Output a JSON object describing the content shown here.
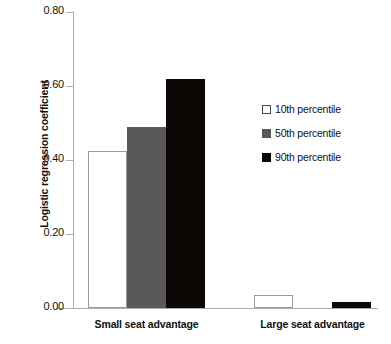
{
  "chart_data": {
    "type": "bar",
    "title": "",
    "xlabel": "",
    "ylabel": "Logistic regression coefficient",
    "categories": [
      "Small seat advantage",
      "Large seat advantage"
    ],
    "series": [
      {
        "name": "10th percentile",
        "values": [
          0.425,
          0.035
        ],
        "color": "#ffffff"
      },
      {
        "name": "50th percentile",
        "values": [
          0.49,
          0.0
        ],
        "color": "#59595a"
      },
      {
        "name": "90th percentile",
        "values": [
          0.62,
          0.016
        ],
        "color": "#0d0806"
      }
    ],
    "ylim": [
      0.0,
      0.8
    ],
    "yticks": [
      0.0,
      0.2,
      0.4,
      0.6,
      0.8
    ],
    "ytick_labels": [
      "0.00",
      "0.20",
      "0.40",
      "0.60",
      "0.80"
    ],
    "grid": false,
    "legend_position": "center-right"
  }
}
